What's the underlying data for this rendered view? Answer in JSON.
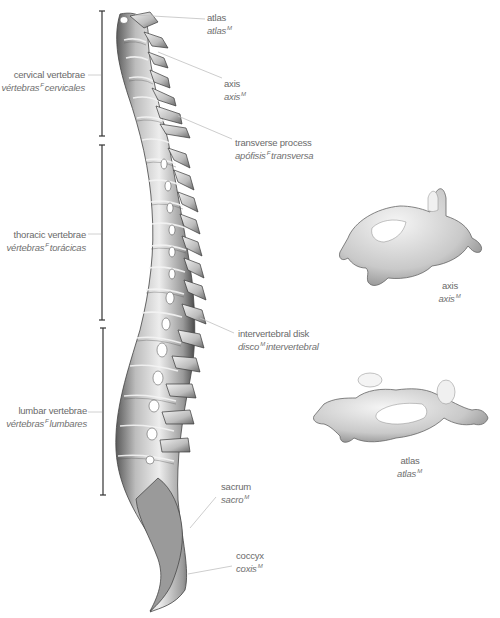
{
  "diagram": {
    "regions": [
      {
        "en": "cervical vertebrae",
        "es_pre": "vértebras",
        "gender": "F",
        "es_post": "cervicales"
      },
      {
        "en": "thoracic vertebrae",
        "es_pre": "vértebras",
        "gender": "F",
        "es_post": "torácicas"
      },
      {
        "en": "lumbar vertebrae",
        "es_pre": "vértebras",
        "gender": "F",
        "es_post": "lumbares"
      }
    ],
    "callouts": [
      {
        "en": "atlas",
        "es_pre": "atlas",
        "gender": "M",
        "es_post": ""
      },
      {
        "en": "axis",
        "es_pre": "axis",
        "gender": "M",
        "es_post": ""
      },
      {
        "en": "transverse process",
        "es_pre": "apófisis",
        "gender": "F",
        "es_post": "transversa"
      },
      {
        "en": "intervertebral disk",
        "es_pre": "disco",
        "gender": "M",
        "es_post": "intervertebral"
      },
      {
        "en": "sacrum",
        "es_pre": "sacro",
        "gender": "M",
        "es_post": ""
      },
      {
        "en": "coccyx",
        "es_pre": "coxis",
        "gender": "M",
        "es_post": ""
      }
    ],
    "detail_views": [
      {
        "en": "axis",
        "es_pre": "axis",
        "gender": "M"
      },
      {
        "en": "atlas",
        "es_pre": "atlas",
        "gender": "M"
      }
    ],
    "colors": {
      "bone_light": "#e6e6e6",
      "bone_mid": "#b9b9b9",
      "bone_dark": "#555555",
      "leader": "#bdbdbd",
      "bracket": "#333333",
      "text": "#6a6a6a"
    }
  }
}
